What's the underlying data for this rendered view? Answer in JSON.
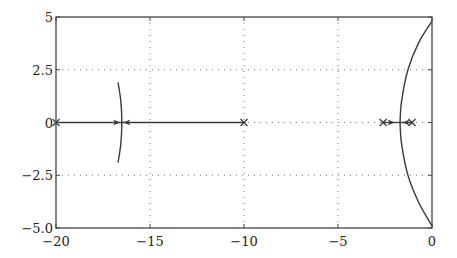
{
  "chart_data": {
    "type": "line",
    "title": "",
    "subtitle": "",
    "xlabel": "",
    "ylabel": "",
    "xlim": [
      -20,
      0
    ],
    "ylim": [
      -5,
      5
    ],
    "grid": true,
    "grid_style": "dotted",
    "legend": null,
    "x_ticks": [
      -20,
      -15,
      -10,
      -5,
      0
    ],
    "x_tick_labels": [
      "−20",
      "−15",
      "−10",
      "−5",
      "0"
    ],
    "y_ticks": [
      5,
      2.5,
      0,
      -2.5,
      -5
    ],
    "y_tick_labels": [
      "5",
      "2.5",
      "0",
      "−2.5",
      "−5.0"
    ],
    "poles": [
      {
        "x": -20,
        "y": 0
      },
      {
        "x": -10,
        "y": 0
      },
      {
        "x": -2.6,
        "y": 0
      },
      {
        "x": -1.06,
        "y": 0
      }
    ],
    "breakaway_points": [
      {
        "x": -16.5,
        "y": 0
      },
      {
        "x": -1.7,
        "y": 0
      }
    ],
    "series": [
      {
        "name": "real-axis branch left",
        "points": [
          [
            -20,
            0
          ],
          [
            -16.5,
            0
          ]
        ],
        "arrow_at": [
          -16.8,
          0
        ],
        "arrow_dir": "right"
      },
      {
        "name": "real-axis branch from -10",
        "points": [
          [
            -10,
            0
          ],
          [
            -16.5,
            0
          ]
        ],
        "arrow_at": [
          -16.2,
          0
        ],
        "arrow_dir": "left"
      },
      {
        "name": "complex branch near -16.5",
        "points": [
          [
            -16.7,
            1.9
          ],
          [
            -16.55,
            1.0
          ],
          [
            -16.5,
            0
          ],
          [
            -16.55,
            -1.0
          ],
          [
            -16.7,
            -1.9
          ]
        ]
      },
      {
        "name": "real-axis branch from -2.6",
        "points": [
          [
            -2.6,
            0
          ],
          [
            -1.7,
            0
          ]
        ],
        "arrow_at": [
          -2.2,
          0
        ],
        "arrow_dir": "right"
      },
      {
        "name": "real-axis branch from -1.06",
        "points": [
          [
            -1.06,
            0
          ],
          [
            -1.7,
            0
          ]
        ],
        "arrow_at": [
          -1.35,
          0
        ],
        "arrow_dir": "left"
      },
      {
        "name": "upper complex branch",
        "points": [
          [
            -1.7,
            0
          ],
          [
            -1.62,
            1.0
          ],
          [
            -1.28,
            2.5
          ],
          [
            -0.7,
            3.8
          ],
          [
            0,
            4.8
          ]
        ]
      },
      {
        "name": "lower complex branch",
        "points": [
          [
            -1.7,
            0
          ],
          [
            -1.62,
            -1.0
          ],
          [
            -1.28,
            -2.5
          ],
          [
            -0.7,
            -3.8
          ],
          [
            0,
            -4.9
          ]
        ]
      }
    ]
  },
  "style": {
    "axis_color": "#444444",
    "line_color": "#3a3a3a",
    "grid_color": "#777777",
    "background": "#ffffff"
  }
}
